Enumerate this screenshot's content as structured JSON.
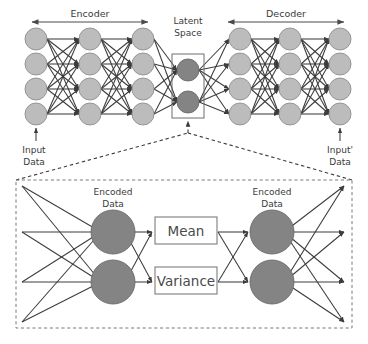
{
  "figure": {
    "background_color": "#ffffff"
  },
  "top": {
    "encoder_label": "Encoder",
    "decoder_label": "Decoder",
    "latent_label_line1": "Latent",
    "latent_label_line2": "Space",
    "input_label_line1": "Input",
    "input_label_line2": "Data",
    "output_label_line1": "Input'",
    "output_label_line2": "Data"
  },
  "detail": {
    "encoded_left_line1": "Encoded",
    "encoded_left_line2": "Data",
    "encoded_right_line1": "Encoded",
    "encoded_right_line2": "Data",
    "mean_label": "Mean",
    "variance_label": "Variance"
  },
  "colors": {
    "node_light": "#bcbcbc",
    "node_dark": "#848484",
    "edge": "#3c3c3c",
    "text": "#3a3a3a",
    "box_stroke": "#7d7d7d",
    "panel_stroke": "#7a7a7a"
  },
  "network": {
    "encoder_layer_sizes": [
      4,
      4,
      4
    ],
    "latent_size": 2,
    "decoder_layer_sizes": [
      4,
      4,
      4
    ],
    "detail_left_inputs": 4,
    "detail_encoded_nodes": 2,
    "detail_gaussian_params": 2,
    "detail_right_outputs": 4
  },
  "icons": {
    "arrow_head": "arrowhead-icon",
    "double_arrow": "double-arrow-icon",
    "up_arrow": "up-arrow-icon"
  }
}
